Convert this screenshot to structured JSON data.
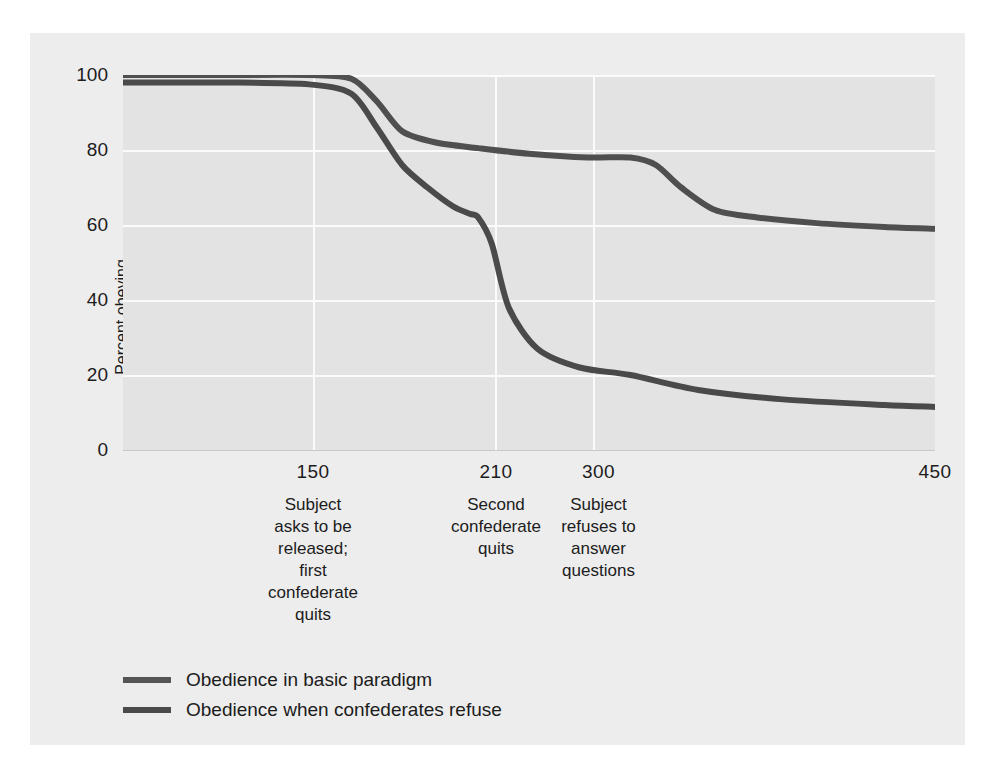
{
  "chart_data": {
    "type": "line",
    "title": "",
    "xlabel": "",
    "ylabel": "Percent obeying",
    "ylim": [
      0,
      100
    ],
    "xlim": [
      0,
      480
    ],
    "grid": true,
    "legend_position": "bottom-left",
    "yticks": [
      "100",
      "80",
      "60",
      "40",
      "20",
      "0"
    ],
    "ytick_values": [
      100,
      80,
      60,
      40,
      20,
      0
    ],
    "xticks": [
      "150",
      "210",
      "300",
      "450"
    ],
    "xtick_values": [
      150,
      210,
      300,
      450
    ],
    "annotations": [
      {
        "x": 150,
        "text": "Subject asks to be released; first confederate quits"
      },
      {
        "x": 210,
        "text": "Second confederate quits"
      },
      {
        "x": 300,
        "text": "Subject refuses to answer questions"
      }
    ],
    "series": [
      {
        "name": "Obedience in basic paradigm",
        "color": "#4f4f4f",
        "x": [
          0,
          60,
          110,
          135,
          150,
          165,
          185,
          210,
          240,
          275,
          300,
          315,
          330,
          350,
          375,
          410,
          450,
          480
        ],
        "values": [
          100,
          100,
          100,
          99,
          93,
          85,
          82,
          80.5,
          79,
          78,
          78,
          76,
          70,
          64,
          62,
          60.5,
          59.5,
          59
        ]
      },
      {
        "name": "Obedience when confederates refuse",
        "color": "#4a4a4a",
        "x": [
          0,
          60,
          110,
          135,
          150,
          165,
          180,
          195,
          205,
          210,
          218,
          228,
          245,
          270,
          300,
          340,
          390,
          450,
          480
        ],
        "values": [
          98,
          98,
          97.5,
          95,
          86,
          76,
          70,
          65,
          63,
          62,
          55,
          38,
          27,
          22,
          20,
          16,
          13.5,
          12,
          11.5
        ]
      }
    ]
  },
  "axis": {
    "y_title": "Percent obeying"
  },
  "xaxis": {
    "groups": [
      {
        "number": "150",
        "lines": [
          "Subject",
          "asks to be",
          "released;",
          "first",
          "confederate",
          "quits"
        ]
      },
      {
        "number": "210",
        "lines": [
          "Second",
          "confederate",
          "quits"
        ]
      },
      {
        "number": "300",
        "lines": [
          "Subject",
          "refuses to",
          "answer",
          "questions"
        ]
      },
      {
        "number": "450",
        "lines": []
      }
    ]
  },
  "legend": {
    "items": [
      {
        "label": "Obedience in basic paradigm",
        "color": "#555555"
      },
      {
        "label": "Obedience when confederates refuse",
        "color": "#4a4a4a"
      }
    ]
  },
  "colors": {
    "page_background": "#ffffff",
    "panel_background": "#ededed",
    "plot_background": "#e3e3e3",
    "gridline": "#fbfbfb",
    "text": "#1c1c1c"
  }
}
